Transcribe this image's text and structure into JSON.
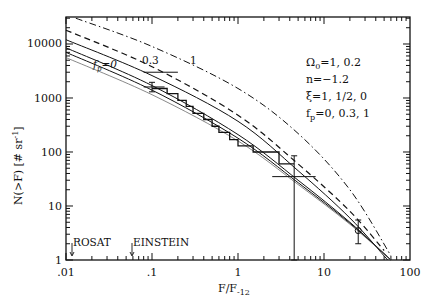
{
  "chart_data": {
    "type": "line",
    "title": "",
    "xlabel": "F/F-12",
    "xlabel_main": "F/F",
    "xlabel_sub": "-12",
    "ylabel": "N(>F) [# sr^-1]",
    "ylabel_main": "N(>F)  [# sr",
    "ylabel_sup": "-1",
    "ylabel_close": "]",
    "xscale": "log",
    "yscale": "log",
    "xlim": [
      0.01,
      100
    ],
    "ylim": [
      1,
      31600
    ],
    "x_tick_labels": [
      ".01",
      ".1",
      "1",
      "10",
      "100"
    ],
    "y_tick_labels": [
      "1",
      "10",
      "100",
      "1000",
      "10000"
    ],
    "legend_position": "upper right (text block)",
    "parameter_text": [
      {
        "main": "Ω",
        "sub": "0",
        "rest": "=1,  0.2"
      },
      {
        "main": "n=−1.2",
        "sub": "",
        "rest": ""
      },
      {
        "main": "ξ=1,  1/2,  0",
        "sub": "",
        "rest": ""
      },
      {
        "main": "f",
        "sub": "p",
        "rest": "=0,  0.3,  1"
      }
    ],
    "curve_labels": [
      {
        "main": "f",
        "sub": "p",
        "rest": "=0"
      },
      {
        "main": "0.3",
        "sub": "",
        "rest": ""
      },
      {
        "main": "1",
        "sub": "",
        "rest": ""
      }
    ],
    "annotations": [
      {
        "text": "ROSAT",
        "x": 0.012,
        "arrow": true
      },
      {
        "text": "EINSTEIN",
        "x": 0.06,
        "arrow": true
      }
    ],
    "series": [
      {
        "name": "fp=1 (dash-dot)",
        "style": "dashdot",
        "x": [
          0.013,
          0.1,
          1,
          5,
          20,
          60
        ],
        "values": [
          30000,
          9000,
          1500,
          220,
          20,
          1.2
        ]
      },
      {
        "name": "fp=0.3 (dashed)",
        "style": "dashed",
        "x": [
          0.01,
          0.1,
          1,
          5,
          20,
          50
        ],
        "values": [
          18000,
          3800,
          480,
          60,
          8,
          1.5
        ]
      },
      {
        "name": "fp=0.3 (solid)",
        "style": "solid",
        "x": [
          0.01,
          0.1,
          1,
          5,
          20,
          55
        ],
        "values": [
          12000,
          2600,
          370,
          45,
          6,
          1
        ]
      },
      {
        "name": "fp=0 xi=1 (solid)",
        "style": "solid",
        "x": [
          0.01,
          0.1,
          1,
          5,
          20,
          60
        ],
        "values": [
          8500,
          1700,
          210,
          30,
          5,
          1
        ]
      },
      {
        "name": "fp=0 xi=1/2 (solid)",
        "style": "solid",
        "x": [
          0.01,
          0.1,
          1,
          5,
          20,
          60
        ],
        "values": [
          7000,
          1400,
          180,
          27,
          4.8,
          1
        ]
      },
      {
        "name": "fp=0 xi=0 (dotted-thin)",
        "style": "solid-thin",
        "x": [
          0.01,
          0.1,
          1,
          5,
          20,
          60
        ],
        "values": [
          5600,
          1150,
          160,
          25,
          4.6,
          1
        ]
      },
      {
        "name": "observed (histogram)",
        "style": "step",
        "x": [
          0.1,
          0.15,
          0.2,
          0.25,
          0.3,
          0.4,
          0.5,
          0.6,
          0.8,
          1.0,
          1.5,
          3.0
        ],
        "values": [
          1500,
          1200,
          900,
          700,
          520,
          400,
          300,
          230,
          170,
          130,
          100,
          60
        ]
      }
    ],
    "error_bars": [
      {
        "x": 0.1,
        "y": 1600,
        "ylow": 1300,
        "yhigh": 1950,
        "xlow": 0.08,
        "xhigh": 0.14
      },
      {
        "x": 0.12,
        "y": 3000,
        "xlow": 0.08,
        "xhigh": 0.2,
        "note": "horizontal bar near 0.3 label"
      },
      {
        "x": 4.5,
        "y": 35,
        "ylow": 1,
        "yhigh": 85,
        "xlow": 2.5,
        "xhigh": 8
      },
      {
        "x": 25,
        "y": 3.5,
        "ylow": 2,
        "yhigh": 5.5,
        "marker": "circle"
      }
    ]
  }
}
